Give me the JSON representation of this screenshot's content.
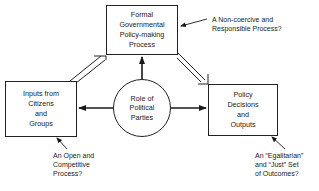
{
  "diagram": {
    "nodes": {
      "top": {
        "lines": [
          "Formal",
          "Governmental",
          "Policy-making",
          "Process"
        ]
      },
      "left": {
        "lines": [
          "Inputs from",
          "Citizens",
          "and",
          "Groups"
        ]
      },
      "right": {
        "lines": [
          "Policy",
          "Decisions",
          "and",
          "Outputs"
        ]
      },
      "center": {
        "lines": [
          "Role of",
          "Political",
          "Parties"
        ]
      }
    },
    "annotations": {
      "top": {
        "lines": [
          "A Non-coercive and",
          "Responsible Process?"
        ]
      },
      "left": {
        "lines": [
          "An Open and",
          "Competitive",
          "Process?"
        ]
      },
      "right": {
        "lines": [
          "An “Egalitarian”",
          "and “Just” Set",
          "of Outcomes?"
        ]
      }
    },
    "edges": [
      {
        "from": "left",
        "to": "top",
        "style": "hollow-double"
      },
      {
        "from": "top",
        "to": "right",
        "style": "hollow-double"
      },
      {
        "from": "center",
        "to": "top",
        "style": "solid"
      },
      {
        "from": "center",
        "to": "left",
        "style": "solid"
      },
      {
        "from": "center",
        "to": "right",
        "style": "solid"
      }
    ]
  }
}
